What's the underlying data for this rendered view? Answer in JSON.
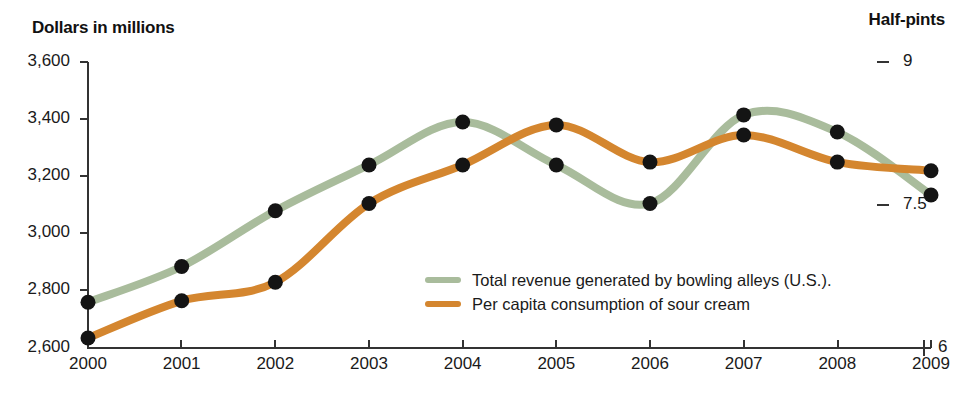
{
  "titles": {
    "left_axis": "Dollars in millions",
    "right_axis": "Half-pints"
  },
  "legend": {
    "items": [
      {
        "label": "Total revenue generated by bowling alleys (U.S.).",
        "color": "#a9bc9c"
      },
      {
        "label": "Per capita consumption of sour cream",
        "color": "#d4862f"
      }
    ]
  },
  "axes": {
    "left_ticks": [
      "3,600",
      "3,400",
      "3,200",
      "3,000",
      "2,800",
      "2,600"
    ],
    "right_ticks": [
      "9",
      "7.5",
      "6"
    ],
    "x_ticks": [
      "2000",
      "2001",
      "2002",
      "2003",
      "2004",
      "2005",
      "2006",
      "2007",
      "2008",
      "2009"
    ]
  },
  "chart_data": {
    "type": "line",
    "title": "",
    "xlabel": "",
    "ylabel": "Dollars in millions",
    "y2label": "Half-pints",
    "x": [
      2000,
      2001,
      2002,
      2003,
      2004,
      2005,
      2006,
      2007,
      2008,
      2009
    ],
    "categories": [
      "2000",
      "2001",
      "2002",
      "2003",
      "2004",
      "2005",
      "2006",
      "2007",
      "2008",
      "2009"
    ],
    "ylim": [
      2600,
      3600
    ],
    "y2lim": [
      6,
      9
    ],
    "yticks": [
      2600,
      2800,
      3000,
      3200,
      3400,
      3600
    ],
    "y2ticks": [
      6,
      7.5,
      9
    ],
    "grid": false,
    "legend_position": "inside-lower-right",
    "markers": "filled-black-circle",
    "series": [
      {
        "name": "Total revenue generated by bowling alleys (U.S.).",
        "axis": "left",
        "units": "dollars in millions",
        "color": "#a9bc9c",
        "values": [
          2760,
          2885,
          3080,
          3240,
          3390,
          3240,
          3105,
          3415,
          3355,
          3135
        ]
      },
      {
        "name": "Per capita consumption of sour cream",
        "axis": "right",
        "units": "half-pints",
        "color": "#d4862f",
        "values": [
          6.1,
          6.49,
          6.69,
          7.51,
          7.92,
          8.34,
          7.95,
          8.23,
          7.95,
          7.86
        ],
        "values_left_axis_equivalent": [
          2635,
          2765,
          2830,
          3105,
          3240,
          3380,
          3250,
          3345,
          3250,
          3220
        ]
      }
    ]
  },
  "colors": {
    "green": "#a9bc9c",
    "orange": "#d4862f",
    "marker": "#141414",
    "axis": "#333333",
    "text": "#1a1a1a"
  }
}
